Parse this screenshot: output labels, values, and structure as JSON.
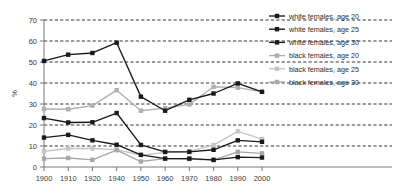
{
  "chart_data": {
    "type": "line",
    "title": "",
    "xlabel": "",
    "ylabel": "%",
    "ylim": [
      0,
      70
    ],
    "ytick_step": 10,
    "grid": true,
    "grid_style": "dashed-horizontal",
    "legend_position": "top-right",
    "categories": [
      "1900",
      "1910",
      "1920",
      "1940",
      "1950",
      "1960",
      "1970",
      "1980",
      "1990",
      "2000"
    ],
    "xtick_labels": [
      "1900",
      "1910",
      "1920",
      "1940",
      "1950",
      "1960",
      "1970",
      "1980",
      "1990",
      "2000"
    ],
    "ytick_labels": [
      "0",
      "10",
      "20",
      "30",
      "40",
      "50",
      "60",
      "70"
    ],
    "series": [
      {
        "name": "white females, age 20",
        "color": "#1a1a1a",
        "marker": "square",
        "values": [
          50.5,
          53.5,
          54.3,
          59.2,
          33.5,
          26.8,
          32.0,
          35.0,
          39.8,
          35.8
        ]
      },
      {
        "name": "white females, age 25",
        "color": "#1a1a1a",
        "marker": "square",
        "values": [
          23.3,
          21.2,
          21.3,
          25.7,
          10.5,
          7.2,
          7.2,
          8.2,
          12.7,
          12.0
        ]
      },
      {
        "name": "white females, age 30",
        "color": "#1a1a1a",
        "marker": "square",
        "values": [
          14.0,
          15.3,
          12.7,
          10.6,
          5.8,
          4.0,
          4.0,
          3.4,
          4.7,
          4.5
        ]
      },
      {
        "name": "black females, age 20",
        "color": "#b0b0b0",
        "marker": "square",
        "values": [
          27.6,
          27.5,
          29.2,
          36.6,
          26.8,
          28.0,
          29.8,
          38.2,
          37.8,
          35.8
        ]
      },
      {
        "name": "black females, age 25",
        "color": "#c4c4c4",
        "marker": "square",
        "values": [
          7.5,
          8.8,
          8.8,
          8.3,
          5.6,
          7.0,
          7.4,
          10.4,
          17.0,
          13.3
        ]
      },
      {
        "name": "black females, age 30",
        "color": "#a8a8a8",
        "marker": "square",
        "values": [
          4.0,
          4.3,
          3.4,
          8.0,
          2.6,
          4.0,
          3.8,
          3.3,
          7.2,
          6.5
        ]
      }
    ]
  },
  "legend": {
    "items": [
      {
        "label": "white females, age 20"
      },
      {
        "label": "white females, age 25"
      },
      {
        "label": "white females, age 30"
      },
      {
        "label": "black females, age 20"
      },
      {
        "label": "black females, age 25"
      },
      {
        "label": "black females, age 30"
      }
    ]
  },
  "axes": {
    "y_title": "%"
  }
}
